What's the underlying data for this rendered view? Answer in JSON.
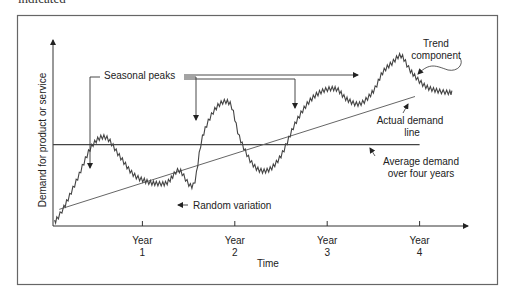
{
  "caption_fragment": "indicated",
  "chart_data": {
    "type": "line",
    "title": "",
    "xlabel": "Time",
    "ylabel": "Demand for product or service",
    "x_ticks": [
      {
        "line1": "Year",
        "line2": "1",
        "value": 1
      },
      {
        "line1": "Year",
        "line2": "2",
        "value": 2
      },
      {
        "line1": "Year",
        "line2": "3",
        "value": 3
      },
      {
        "line1": "Year",
        "line2": "4",
        "value": 4
      }
    ],
    "xlim": [
      0.05,
      4.55
    ],
    "ylim": [
      0,
      1
    ],
    "grid": false,
    "series": [
      {
        "name": "Actual demand line",
        "description": "seasonal wave superimposed on rising trend, with random jitter",
        "x": [
          0.05,
          0.15,
          0.3,
          0.45,
          0.6,
          0.75,
          0.9,
          1.05,
          1.15,
          1.25,
          1.3,
          1.4,
          1.55,
          1.65,
          1.8,
          1.95,
          2.05,
          2.2,
          2.35,
          2.5,
          2.65,
          2.8,
          2.95,
          3.1,
          3.2,
          3.35,
          3.5,
          3.6,
          3.7,
          3.8,
          3.9,
          4.05,
          4.2,
          4.35
        ],
        "y": [
          0.02,
          0.1,
          0.26,
          0.43,
          0.48,
          0.38,
          0.28,
          0.24,
          0.23,
          0.23,
          0.25,
          0.3,
          0.22,
          0.48,
          0.64,
          0.66,
          0.48,
          0.33,
          0.3,
          0.38,
          0.55,
          0.67,
          0.73,
          0.74,
          0.69,
          0.66,
          0.73,
          0.83,
          0.88,
          0.92,
          0.84,
          0.76,
          0.73,
          0.72
        ]
      },
      {
        "name": "Trend component",
        "x": [
          0.1,
          3.95
        ],
        "y": [
          0.09,
          0.7
        ]
      },
      {
        "name": "Average demand over four years",
        "x": [
          0.05,
          4.0
        ],
        "y": [
          0.44,
          0.44
        ]
      }
    ],
    "annotations": [
      {
        "text": "Seasonal peaks",
        "points_to": [
          "peak year 1",
          "peak year 2",
          "peak year 3",
          "peak year 4"
        ]
      },
      {
        "text": "Random variation",
        "points_to": "dip near x≈1.3"
      },
      {
        "line1": "Trend",
        "line2": "component",
        "points_to": "trend line"
      },
      {
        "line1": "Actual demand",
        "line2": "line",
        "points_to": "actual demand series"
      },
      {
        "line1": "Average demand",
        "line2": "over four years",
        "points_to": "average line"
      }
    ]
  }
}
